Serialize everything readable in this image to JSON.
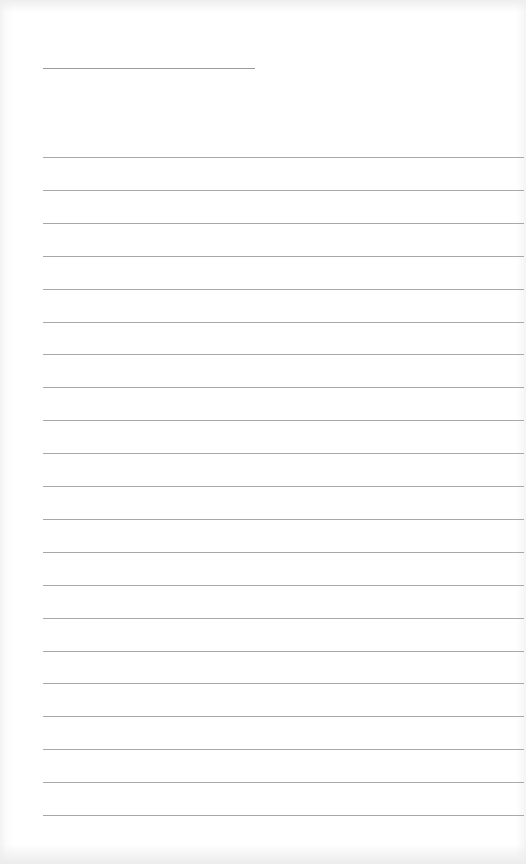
{
  "document": {
    "type": "lined-paper",
    "colors": {
      "paper": "#ffffff",
      "line": "#a8a8a8",
      "header_line": "#9a9a9a"
    },
    "header_line": {
      "x": 43,
      "y": 68,
      "width": 212
    },
    "ruled_lines": {
      "count": 21,
      "x": 43,
      "first_y": 157,
      "spacing": 32.9,
      "width": 481
    }
  }
}
